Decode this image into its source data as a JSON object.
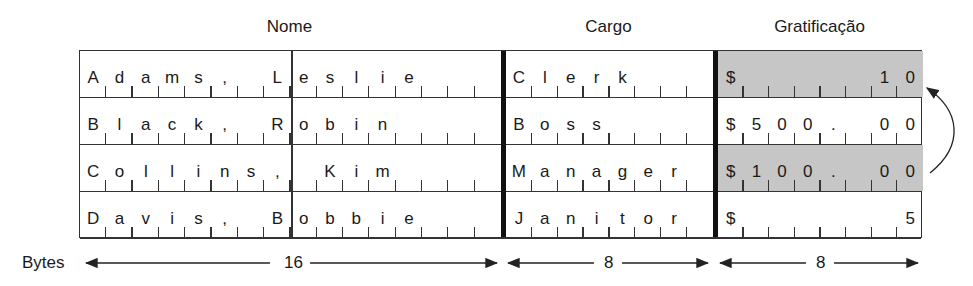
{
  "headers": {
    "name": "Nome",
    "job": "Cargo",
    "bonus": "Gratificação"
  },
  "rows": [
    {
      "name_bytes": [
        "A",
        "d",
        "a",
        "m",
        "s",
        ",",
        " ",
        "L",
        "e",
        "s",
        "l",
        "i",
        "e",
        " ",
        " ",
        " "
      ],
      "job_bytes": [
        "C",
        "l",
        "e",
        "r",
        "k",
        " ",
        " ",
        " "
      ],
      "bonus_bytes": [
        "$",
        " ",
        " ",
        " ",
        " ",
        " ",
        "1",
        "0"
      ],
      "bonus_shaded": true
    },
    {
      "name_bytes": [
        "B",
        "l",
        "a",
        "c",
        "k",
        ",",
        " ",
        "R",
        "o",
        "b",
        "i",
        "n",
        " ",
        " ",
        " ",
        " "
      ],
      "job_bytes": [
        "B",
        "o",
        "s",
        "s",
        " ",
        " ",
        " ",
        " "
      ],
      "bonus_bytes": [
        "$",
        "5",
        "0",
        "0",
        ".",
        " ",
        "0",
        "0",
        "0"
      ],
      "bonus_shaded": false
    },
    {
      "name_bytes": [
        "C",
        "o",
        "l",
        "l",
        "i",
        "n",
        "s",
        ",",
        " ",
        "K",
        "i",
        "m",
        " ",
        " ",
        " ",
        " "
      ],
      "job_bytes": [
        "M",
        "a",
        "n",
        "a",
        "g",
        "e",
        "r",
        " "
      ],
      "bonus_bytes": [
        "$",
        "1",
        "0",
        "0",
        ".",
        " ",
        "0",
        "0",
        "0"
      ],
      "bonus_shaded": true
    },
    {
      "name_bytes": [
        "D",
        "a",
        "v",
        "i",
        "s",
        ",",
        " ",
        "B",
        "o",
        "b",
        "b",
        "i",
        "e",
        " ",
        " ",
        " "
      ],
      "job_bytes": [
        "J",
        "a",
        "n",
        "i",
        "t",
        "o",
        "r",
        " "
      ],
      "bonus_bytes": [
        "$",
        " ",
        " ",
        " ",
        " ",
        " ",
        " ",
        "5"
      ],
      "bonus_shaded": false
    }
  ],
  "dimension": {
    "label": "Bytes",
    "name_width": "16",
    "job_width": "8",
    "bonus_width": "8"
  },
  "annotation": {
    "arrow": "swap-arrow-row3-to-row1"
  },
  "colors": {
    "shade": "#c6c6c6",
    "line": "#333333"
  }
}
